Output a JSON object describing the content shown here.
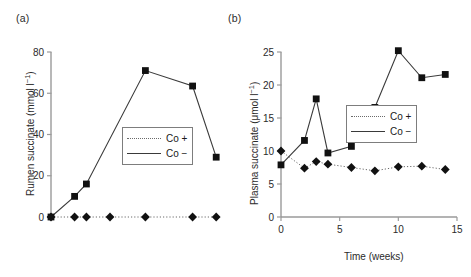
{
  "figure": {
    "panel_a_label": "(a)",
    "panel_b_label": "(b)"
  },
  "legend": {
    "co_plus_label": "Co +",
    "co_minus_label": "Co −",
    "co_plus_marker": "diamond-marker",
    "co_minus_marker": "square-marker",
    "co_plus_linestyle": "dotted",
    "co_minus_linestyle": "solid"
  },
  "colors": {
    "marker": "#111111",
    "co_minus_line": "#3a3a3a",
    "co_plus_line": "#6a6a6a",
    "axis": "#9a9a9a",
    "text": "#1a1a1a",
    "legend_border": "#7d7d7d",
    "background": "#ffffff"
  },
  "chart_data": [
    {
      "type": "line",
      "panel": "(a)",
      "title": "",
      "xlabel": "",
      "ylabel_prefix": "Rumen succinate (mmol l",
      "ylabel_sup": "−1",
      "ylabel_suffix": ")",
      "ylabel": "Rumen succinate (mmol l⁻¹)",
      "xlim": [
        0,
        15
      ],
      "ylim": [
        0,
        80
      ],
      "yticks": [
        0,
        20,
        40,
        60,
        80
      ],
      "ytick_labels": [
        "0",
        "20",
        "40",
        "60",
        "80"
      ],
      "xticks": [],
      "xtick_labels": [],
      "xaxis_visible": false,
      "grid": false,
      "legend_position": "center-right",
      "series": [
        {
          "name": "Co +",
          "marker": "diamond",
          "linestyle": "dotted",
          "x": [
            0,
            2,
            3,
            5,
            8,
            12,
            14
          ],
          "values": [
            0,
            0,
            0,
            0,
            0,
            0,
            0
          ]
        },
        {
          "name": "Co −",
          "marker": "square",
          "linestyle": "solid",
          "x": [
            0,
            2,
            3,
            8,
            12,
            14
          ],
          "values": [
            0,
            10,
            16,
            71,
            63.5,
            29
          ]
        }
      ]
    },
    {
      "type": "line",
      "panel": "(b)",
      "title": "",
      "xlabel": "Time (weeks)",
      "ylabel_prefix": "Plasma succinate (μmol l",
      "ylabel_sup": "−1",
      "ylabel_suffix": ")",
      "ylabel": "Plasma succinate (μmol l⁻¹)",
      "xlim": [
        0,
        15
      ],
      "ylim": [
        0,
        25
      ],
      "yticks": [
        0,
        5,
        10,
        15,
        20,
        25
      ],
      "ytick_labels": [
        "0",
        "5",
        "10",
        "15",
        "20",
        "25"
      ],
      "xticks": [
        0,
        5,
        10,
        15
      ],
      "xtick_labels": [
        "0",
        "5",
        "10",
        "15"
      ],
      "xaxis_visible": true,
      "grid": false,
      "legend_position": "center-right",
      "series": [
        {
          "name": "Co +",
          "marker": "diamond",
          "linestyle": "dotted",
          "x": [
            0,
            2,
            3,
            4,
            6,
            8,
            10,
            12,
            14
          ],
          "values": [
            10.0,
            7.4,
            8.4,
            8.0,
            7.5,
            7.0,
            7.6,
            7.7,
            7.2
          ]
        },
        {
          "name": "Co −",
          "marker": "square",
          "linestyle": "solid",
          "x": [
            0,
            2,
            3,
            4,
            6,
            8,
            10,
            12,
            14
          ],
          "values": [
            7.9,
            11.6,
            17.9,
            9.7,
            10.7,
            16.6,
            25.2,
            21.1,
            21.6
          ]
        }
      ]
    }
  ]
}
